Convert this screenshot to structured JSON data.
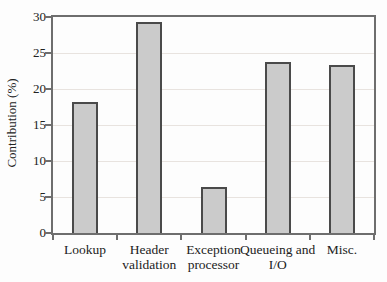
{
  "figure": {
    "background": "#fdfdfd",
    "frame_color": "#6e6e6e",
    "grid_color": "#e8e3df",
    "bar_fill": "#cbcbcb",
    "bar_border": "#4a4a4a",
    "text_color": "#222222"
  },
  "chart_data": {
    "type": "bar",
    "title": "",
    "xlabel": "",
    "ylabel": "Contribution (%)",
    "categories": [
      "Lookup",
      "Header validation",
      "Exception processor",
      "Queueing and I/O",
      "Misc."
    ],
    "values": [
      18.2,
      29.3,
      6.4,
      23.8,
      23.4
    ],
    "ylim": [
      0,
      30
    ],
    "yticks": [
      0,
      5,
      10,
      15,
      20,
      25,
      30
    ],
    "grid": "horizontal-light",
    "legend": "none",
    "frame": "full-box"
  }
}
